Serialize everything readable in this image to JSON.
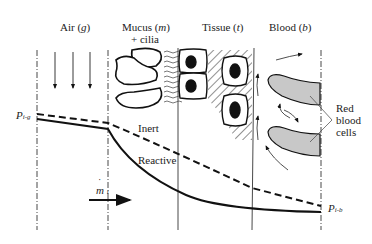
{
  "regions": [
    {
      "name": "Air",
      "symbol": "g",
      "label": "Air (g)"
    },
    {
      "name": "Mucus",
      "symbol": "m",
      "label": "Mucus (m)",
      "sublabel": "+ cilia"
    },
    {
      "name": "Tissue",
      "symbol": "t",
      "label": "Tissue (t)"
    },
    {
      "name": "Blood",
      "symbol": "b",
      "label": "Blood (b)"
    }
  ],
  "labels": {
    "air": "Air (",
    "air_sym": "g",
    "mucus": "Mucus (",
    "mucus_sym": "m",
    "cilia": "+ cilia",
    "tissue": "Tissue (",
    "tissue_sym": "t",
    "blood": "Blood (",
    "blood_sym": "b",
    "close": ")",
    "inert": "Inert",
    "reactive": "Reactive",
    "rbc_line1": "Red",
    "rbc_line2": "blood",
    "rbc_line3": "cells",
    "p_left": "P",
    "p_left_sub": "i-g",
    "p_right": "P",
    "p_right_sub": "i-b",
    "flux": "m",
    "flux_sub": "i"
  },
  "curves": [
    {
      "name": "Inert",
      "style": "dashed",
      "description": "Partial pressure profile of inert gas, gradual decline"
    },
    {
      "name": "Reactive",
      "style": "solid",
      "description": "Partial pressure profile of reactive gas, steep decline in mucus/tissue"
    }
  ],
  "colors": {
    "stroke": "#111111",
    "rbc_fill": "#c8c8c8",
    "background": "#ffffff"
  }
}
